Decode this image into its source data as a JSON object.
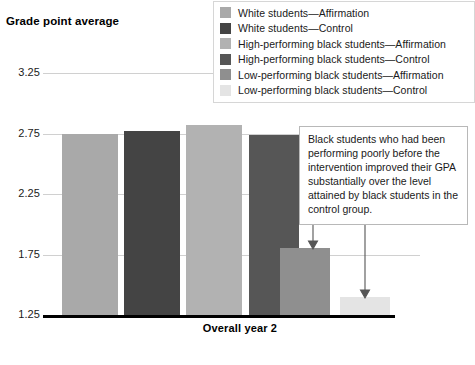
{
  "chart_data": {
    "type": "bar",
    "title": "Grade point average",
    "xlabel": "Overall year 2",
    "ylabel": "Grade point average",
    "ylim": [
      1.25,
      3.25
    ],
    "yticks": [
      "1.25",
      "1.75",
      "2.25",
      "2.75",
      "3.25"
    ],
    "ytick_values": [
      1.25,
      1.75,
      2.25,
      2.75,
      3.25
    ],
    "grid": true,
    "legend_position": "top-right",
    "categories": [
      "Overall year 2"
    ],
    "series": [
      {
        "name": "White students—Affirmation",
        "values": [
          2.75
        ],
        "color": "#a9a9a9"
      },
      {
        "name": "White students—Control",
        "values": [
          2.77
        ],
        "color": "#444444"
      },
      {
        "name": "High-performing black students—Affirmation",
        "values": [
          2.82
        ],
        "color": "#b2b2b2"
      },
      {
        "name": "High-performing black students—Control",
        "values": [
          2.74
        ],
        "color": "#565656"
      },
      {
        "name": "Low-performing black students—Affirmation",
        "values": [
          1.8
        ],
        "color": "#8f8f8f"
      },
      {
        "name": "Low-performing black students—Control",
        "values": [
          1.4
        ],
        "color": "#e4e4e4"
      }
    ],
    "annotations": [
      {
        "text": "Black students who had been performing poorly before the intervention improved their GPA substantially over the level attained by black students in the control group.",
        "points_to": [
          "Low-performing black students—Affirmation",
          "Low-performing black students—Control"
        ]
      }
    ]
  },
  "legend": {
    "items": [
      {
        "label": "White students—Affirmation",
        "color": "#a9a9a9"
      },
      {
        "label": "White students—Control",
        "color": "#444444"
      },
      {
        "label": "High-performing black students—Affirmation",
        "color": "#b2b2b2"
      },
      {
        "label": "High-performing black students—Control",
        "color": "#565656"
      },
      {
        "label": "Low-performing black students—Affirmation",
        "color": "#8f8f8f"
      },
      {
        "label": "Low-performing black students—Control",
        "color": "#e4e4e4"
      }
    ]
  }
}
